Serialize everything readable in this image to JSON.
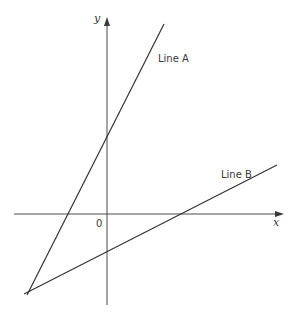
{
  "diagram": {
    "type": "coordinate-plane",
    "axes": {
      "x_label": "x",
      "y_label": "y",
      "origin_label": "0"
    },
    "lines": [
      {
        "name": "Line A",
        "label": "Line A",
        "slope_sign": "positive",
        "y_intercept": "positive",
        "x_intercept": "negative"
      },
      {
        "name": "Line B",
        "label": "Line B",
        "slope_sign": "positive",
        "y_intercept": "negative",
        "x_intercept": "positive"
      }
    ],
    "intersection": "Line A and Line B intersect in the third quadrant"
  }
}
